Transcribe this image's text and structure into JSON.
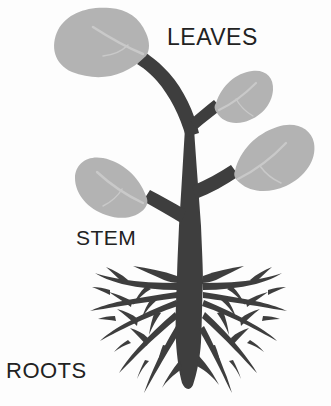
{
  "diagram": {
    "background_color": "#fdfdfd",
    "width": 331,
    "height": 406
  },
  "labels": {
    "leaves": "LEAVES",
    "stem": "STEM",
    "roots": "ROOTS"
  },
  "colors": {
    "stem": "#3e3e3e",
    "roots": "#3e3e3e",
    "leaf_fill": "#b3b3b3",
    "leaf_vein": "#c9c9c9",
    "text": "#222222",
    "background": "#fdfdfd"
  },
  "parts": [
    {
      "name": "leaves",
      "label": "LEAVES",
      "count": 4,
      "color": "#b3b3b3",
      "items": [
        {
          "name": "leaf-large-upper-left",
          "size": "large",
          "direction": "upper-left"
        },
        {
          "name": "leaf-small-upper-right",
          "size": "small",
          "direction": "upper-right"
        },
        {
          "name": "leaf-medium-right",
          "size": "medium",
          "direction": "right"
        },
        {
          "name": "leaf-medium-left",
          "size": "medium",
          "direction": "left"
        }
      ]
    },
    {
      "name": "stem",
      "label": "STEM",
      "color": "#3e3e3e",
      "description": "central trunk with branches to each leaf"
    },
    {
      "name": "roots",
      "label": "ROOTS",
      "color": "#3e3e3e",
      "description": "dense fan of tapering lateral roots around a central taproot"
    }
  ]
}
